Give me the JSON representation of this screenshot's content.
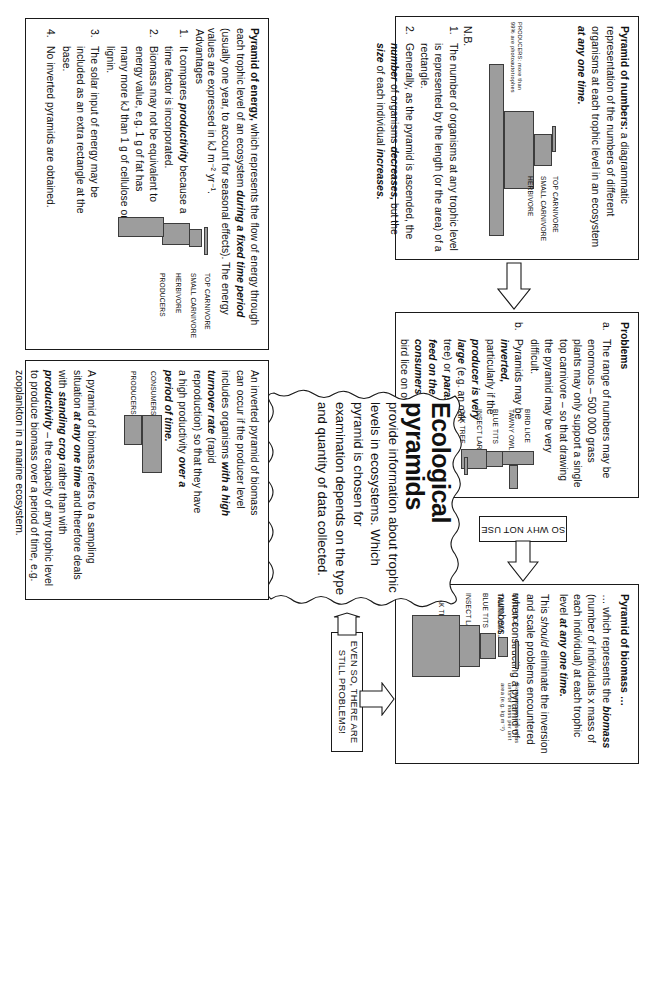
{
  "title": "Ecological pyramids",
  "center": {
    "heading_line1": "Ecological",
    "heading_line2": "pyramids",
    "body": "provide information about trophic levels in ecosystems. Which pyramid is chosen for examination depends on the type and quantity of data collected."
  },
  "pyramid_of_numbers": {
    "heading": "Pyramid of numbers:",
    "intro_a": " a diagrammatic representation of the numbers of different organisms at each trophic level in an ecosystem ",
    "intro_b": "at any one time.",
    "nb_label": "N.B.",
    "notes": [
      {
        "marker": "1.",
        "text": "The number of organisms at any trophic level is represented by the length (or the area) of a rectangle."
      },
      {
        "marker": "2.",
        "parts": [
          "Generally, as the pyramid is ascended, the ",
          "number",
          " of organisms ",
          "decreases,",
          " but the ",
          "size",
          " of each individual ",
          "increases."
        ]
      }
    ],
    "diagram": {
      "levels": [
        "TOP CARNIVORE",
        "SMALL CARNIVORE",
        "HERBIVORE"
      ],
      "producer_note_line1": "PRODUCERS: more than",
      "producer_note_line2": "99% are photoautotrophes"
    }
  },
  "problems": {
    "heading": "Problems",
    "items": [
      {
        "marker": "a.",
        "text": "The range of numbers may be enormous – 500 000 grass plants may only support a single top carnivore – so that drawing the pyramid may be very difficult."
      },
      {
        "marker": "b.",
        "parts": [
          "Pyramids may be ",
          "inverted,",
          " particularly if the ",
          "producer is very large",
          " (e.g. an oak tree) or ",
          "parasites feed on the consumers",
          " (e.g. bird lice on owl)."
        ]
      }
    ],
    "diagram": {
      "levels": [
        "BIRD LICE",
        "TAWNY OWL",
        "BLUE TITS",
        "INSECT LARVAE",
        "OAK TREE"
      ]
    }
  },
  "pyramid_of_biomass": {
    "heading": "Pyramid of biomass …",
    "lead": "… which represents the ",
    "lead_b1": "biomass",
    "lead_mid": " (number of individuals x mass of each individual) at each trophic level ",
    "lead_b2": "at any one time.",
    "para2_a": "This ",
    "para2_i": "should",
    "para2_b": " eliminate the inversion and scale problems encountered when constructing a pyramid of numbers.",
    "diagram": {
      "levels": [
        "BIRD LICE",
        "TAWNY OWL",
        "BLUE TITS",
        "INSECT LARVAE",
        "OAK TREE"
      ],
      "units_note": "Biomass expressed as units of mass per unit area (e.g. kg m⁻²)"
    }
  },
  "inverted_biomass": {
    "para1_parts": [
      "An inverted pyramid of biomass can occur if the producer level includes organisms ",
      "with a high turnover rate",
      " (rapid reproduction) so that they have a high productivity ",
      "over a period of time."
    ],
    "para2_parts": [
      "A pyramid of biomass refers to a sampling situation ",
      "at any one time",
      " and therefore deals with ",
      "standing crop",
      " rather than with ",
      "productivity",
      " – the capacity of any trophic level to produce biomass over a period of time, e.g. zooplankton in a marine ecosystem."
    ],
    "diagram": {
      "levels": [
        "CONSUMERS",
        "PRODUCERS"
      ]
    }
  },
  "pyramid_of_energy": {
    "heading": "Pyramid of energy,",
    "intro_a": " which represents the flow of energy through each trophic level of an ecosystem ",
    "intro_b": "during a fixed time period",
    "intro_c": " (usually one year, to account for seasonal effects). The energy values are expressed in kJ m⁻² yr⁻¹.",
    "advantages_label": "Advantages",
    "advantages": [
      {
        "marker": "1.",
        "parts": [
          "It compares ",
          "productivity",
          " because a time factor is incorporated."
        ]
      },
      {
        "marker": "2.",
        "text": "Biomass may not be equivalent to energy value, e.g. 1 g of fat has many more kJ than 1 g of cellulose or lignin."
      },
      {
        "marker": "3.",
        "text": "The solar input of energy may be included as an extra rectangle at the base."
      },
      {
        "marker": "4.",
        "text": "No inverted pyramids are obtained."
      }
    ],
    "diagram": {
      "levels": [
        "TOP CARNIVORE",
        "SMALL CARNIVORE",
        "HERBIVORE",
        "PRODUCERS"
      ]
    }
  },
  "connectors": {
    "so_why_not_use": "SO WHY NOT USE",
    "even_so": "EVEN SO, THERE ARE STILL PROBLEMS!",
    "so_it_might": "SO IT MIGHT BE BETTER TO CONSIDER"
  },
  "colors": {
    "bar_fill": "#9d9d9d",
    "bar_stroke": "#3c3c3c",
    "box_stroke": "#1a1a1a",
    "text": "#111111"
  }
}
